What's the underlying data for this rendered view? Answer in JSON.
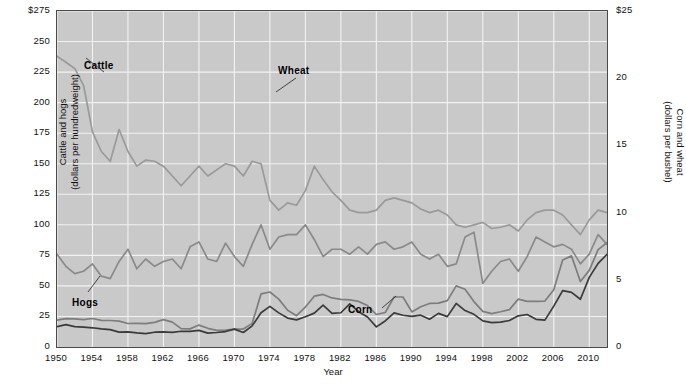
{
  "chart_data": {
    "type": "line",
    "title": "",
    "subtitle": "",
    "xlabel": "Year",
    "ylabel_left": "Cattle and hogs (dollars per hundredweight)",
    "ylabel_right": "Corn and wheat (dollars per bushel)",
    "grid": true,
    "legend_position": "inline-annotations",
    "xlim": [
      1950,
      2012
    ],
    "ylim_left": [
      0,
      275
    ],
    "ylim_right": [
      0,
      25
    ],
    "left_axis": {
      "label_line1": "Cattle and hogs",
      "label_line2": "(dollars per hundredweight)",
      "ticks": [
        0,
        25,
        50,
        75,
        100,
        125,
        150,
        175,
        200,
        225,
        250,
        275
      ],
      "tick_labels": [
        "0",
        "25",
        "50",
        "75",
        "100",
        "125",
        "150",
        "175",
        "200",
        "225",
        "250",
        "$275"
      ]
    },
    "right_axis": {
      "label_line1": "Corn and wheat",
      "label_line2": "(dollars per bushel)",
      "ticks": [
        0,
        5,
        10,
        15,
        20,
        25
      ],
      "tick_labels": [
        "0",
        "5",
        "10",
        "15",
        "20",
        "$25"
      ]
    },
    "x_tick_labels": [
      "1950",
      "1954",
      "1958",
      "1962",
      "1966",
      "1970",
      "1974",
      "1978",
      "1982",
      "1986",
      "1990",
      "1994",
      "1998",
      "2002",
      "2006",
      "2010"
    ],
    "x_ticks": [
      1950,
      1954,
      1958,
      1962,
      1966,
      1970,
      1974,
      1978,
      1982,
      1986,
      1990,
      1994,
      1998,
      2002,
      2006,
      2010
    ],
    "x": [
      1950,
      1951,
      1952,
      1953,
      1954,
      1955,
      1956,
      1957,
      1958,
      1959,
      1960,
      1961,
      1962,
      1963,
      1964,
      1965,
      1966,
      1967,
      1968,
      1969,
      1970,
      1971,
      1972,
      1973,
      1974,
      1975,
      1976,
      1977,
      1978,
      1979,
      1980,
      1981,
      1982,
      1983,
      1984,
      1985,
      1986,
      1987,
      1988,
      1989,
      1990,
      1991,
      1992,
      1993,
      1994,
      1995,
      1996,
      1997,
      1998,
      1999,
      2000,
      2001,
      2002,
      2003,
      2004,
      2005,
      2006,
      2007,
      2008,
      2009,
      2010,
      2011,
      2012
    ],
    "series": [
      {
        "name": "Cattle",
        "color": "#9a9a9a",
        "axis": "left",
        "units": "dollars per hundredweight",
        "values": [
          238,
          233,
          228,
          214,
          176,
          160,
          152,
          178,
          160,
          148,
          153,
          152,
          148,
          140,
          132,
          140,
          148,
          140,
          145,
          150,
          148,
          140,
          152,
          150,
          120,
          112,
          118,
          116,
          128,
          148,
          137,
          127,
          120,
          112,
          110,
          110,
          112,
          120,
          122,
          120,
          118,
          113,
          110,
          112,
          108,
          100,
          98,
          100,
          102,
          97,
          98,
          100,
          95,
          104,
          110,
          112,
          112,
          108,
          100,
          92,
          104,
          112,
          110
        ]
      },
      {
        "name": "Hogs",
        "color": "#8a8a8a",
        "axis": "left",
        "units": "dollars per hundredweight",
        "values": [
          76,
          66,
          60,
          62,
          68,
          58,
          56,
          70,
          80,
          64,
          72,
          66,
          70,
          72,
          64,
          82,
          86,
          72,
          70,
          85,
          74,
          66,
          84,
          100,
          80,
          90,
          92,
          92,
          100,
          88,
          74,
          80,
          80,
          76,
          82,
          76,
          84,
          86,
          80,
          82,
          86,
          76,
          72,
          76,
          66,
          68,
          90,
          94,
          52,
          62,
          70,
          72,
          62,
          74,
          90,
          86,
          82,
          84,
          80,
          68,
          76,
          92,
          84
        ]
      },
      {
        "name": "Wheat",
        "color": "#7d7d7d",
        "axis": "right",
        "units": "dollars per bushel",
        "values": [
          2.0,
          2.11,
          2.09,
          2.04,
          2.12,
          1.98,
          1.97,
          1.93,
          1.75,
          1.76,
          1.74,
          1.83,
          2.04,
          1.85,
          1.37,
          1.35,
          1.63,
          1.39,
          1.24,
          1.25,
          1.33,
          1.34,
          1.76,
          3.95,
          4.09,
          3.56,
          2.73,
          2.33,
          2.97,
          3.78,
          3.91,
          3.65,
          3.55,
          3.51,
          3.39,
          3.08,
          2.42,
          2.57,
          3.72,
          3.72,
          2.61,
          3.0,
          3.24,
          3.26,
          3.45,
          4.55,
          4.3,
          3.38,
          2.65,
          2.48,
          2.62,
          2.78,
          3.56,
          3.4,
          3.4,
          3.42,
          4.26,
          6.48,
          6.78,
          4.87,
          5.7,
          7.24,
          7.77
        ]
      },
      {
        "name": "Corn",
        "color": "#3a3a3a",
        "axis": "right",
        "units": "dollars per bushel",
        "values": [
          1.52,
          1.66,
          1.52,
          1.48,
          1.43,
          1.35,
          1.29,
          1.11,
          1.12,
          1.05,
          1.0,
          1.1,
          1.12,
          1.09,
          1.17,
          1.16,
          1.24,
          1.03,
          1.08,
          1.15,
          1.33,
          1.08,
          1.57,
          2.55,
          3.02,
          2.54,
          2.15,
          2.02,
          2.25,
          2.52,
          3.11,
          2.5,
          2.55,
          3.21,
          2.63,
          2.23,
          1.5,
          1.94,
          2.54,
          2.36,
          2.28,
          2.37,
          2.07,
          2.5,
          2.26,
          3.24,
          2.71,
          2.43,
          1.94,
          1.82,
          1.85,
          1.97,
          2.32,
          2.42,
          2.06,
          2.0,
          3.04,
          4.2,
          4.06,
          3.55,
          5.18,
          6.22,
          6.89
        ]
      }
    ],
    "annotations": [
      {
        "name": "Cattle",
        "text": "Cattle"
      },
      {
        "name": "Wheat",
        "text": "Wheat"
      },
      {
        "name": "Hogs",
        "text": "Hogs"
      },
      {
        "name": "Corn",
        "text": "Corn"
      }
    ]
  }
}
